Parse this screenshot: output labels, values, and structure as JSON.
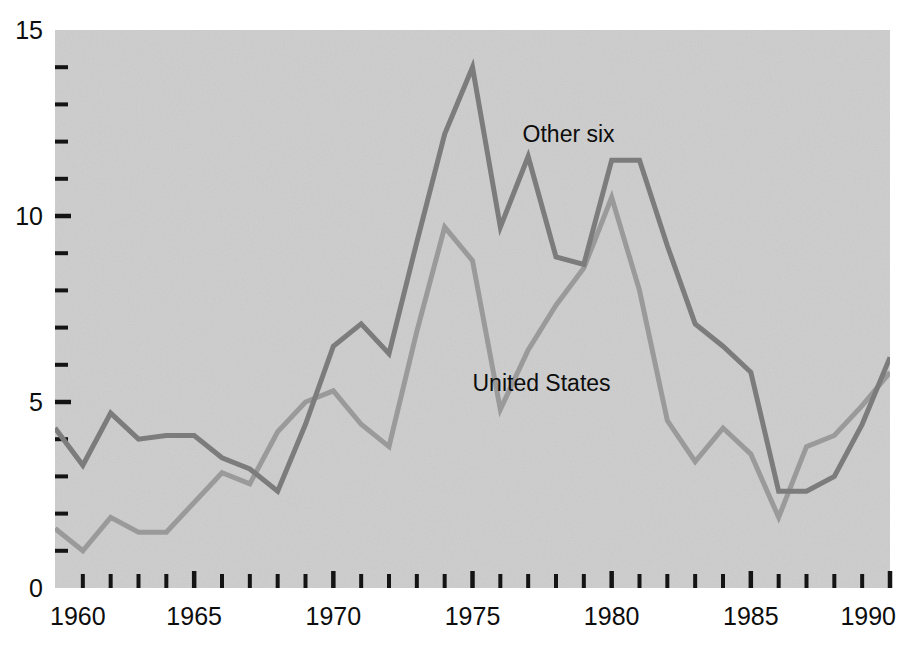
{
  "chart_data": {
    "type": "line",
    "title": "",
    "subtitle": "",
    "xlabel": "",
    "ylabel": "",
    "xlim": [
      1960,
      1990
    ],
    "ylim": [
      0,
      15
    ],
    "grid": false,
    "legend_position": "inline-annotations",
    "plot_background_color": "#cdcdcd",
    "figure_background_color": "#ffffff",
    "x_tick_labels": [
      "1960",
      "1965",
      "1970",
      "1975",
      "1980",
      "1985",
      "1990"
    ],
    "x_major_ticks": [
      1960,
      1965,
      1970,
      1975,
      1980,
      1985,
      1990
    ],
    "x_minor_tick_step": 1,
    "y_tick_labels": [
      "0",
      "5",
      "10",
      "15"
    ],
    "y_major_ticks": [
      0,
      5,
      10,
      15
    ],
    "y_minor_tick_step": 1,
    "x": [
      1960,
      1961,
      1962,
      1963,
      1964,
      1965,
      1966,
      1967,
      1968,
      1969,
      1970,
      1971,
      1972,
      1973,
      1974,
      1975,
      1976,
      1977,
      1978,
      1979,
      1980,
      1981,
      1982,
      1983,
      1984,
      1985,
      1986,
      1987,
      1988,
      1989,
      1990
    ],
    "series": [
      {
        "name": "Other six",
        "color": "#7c7c7c",
        "line_width": 5,
        "values": [
          4.3,
          3.3,
          4.7,
          4.0,
          4.1,
          4.1,
          3.5,
          3.2,
          2.6,
          4.4,
          6.5,
          7.1,
          6.3,
          9.3,
          12.2,
          14.0,
          9.7,
          11.6,
          8.9,
          8.7,
          11.5,
          11.5,
          9.2,
          7.1,
          6.5,
          5.8,
          2.6,
          2.6,
          3.0,
          4.4,
          6.2
        ]
      },
      {
        "name": "United States",
        "color": "#9a9a9a",
        "line_width": 5,
        "values": [
          1.6,
          1.0,
          1.9,
          1.5,
          1.5,
          2.3,
          3.1,
          2.8,
          4.2,
          5.0,
          5.3,
          4.4,
          3.8,
          6.9,
          9.7,
          8.8,
          4.8,
          6.4,
          7.6,
          8.6,
          10.5,
          8.0,
          4.5,
          3.4,
          4.3,
          3.6,
          1.9,
          3.8,
          4.1,
          4.9,
          5.8
        ]
      }
    ],
    "annotations": [
      {
        "text": "Other six",
        "x": 1976.8,
        "y": 12.0
      },
      {
        "text": "United States",
        "x": 1975.0,
        "y": 5.3
      }
    ]
  }
}
